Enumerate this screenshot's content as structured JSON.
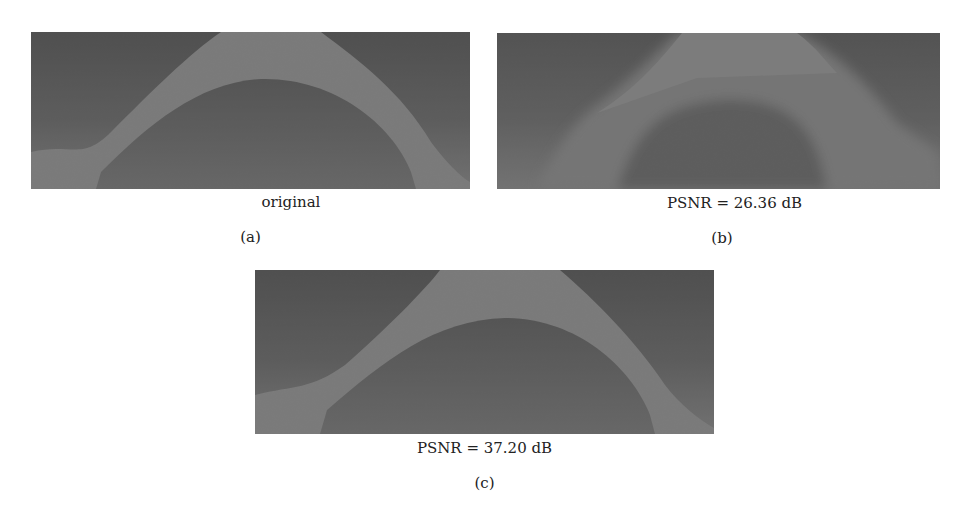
{
  "figure": {
    "panels": [
      {
        "id": "a",
        "caption": "original",
        "label": "(a)"
      },
      {
        "id": "b",
        "caption": "PSNR = 26.36 dB",
        "label": "(b)"
      },
      {
        "id": "c",
        "caption": "PSNR = 37.20 dB",
        "label": "(c)"
      }
    ]
  },
  "colors": {
    "background_dark": "#3a3a3a",
    "background_mid": "#555555",
    "arch": "#7d7d7d",
    "inner_dark": "#444444"
  }
}
